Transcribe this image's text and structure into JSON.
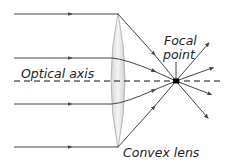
{
  "diagram": {
    "type": "optics-ray-diagram",
    "labels": {
      "optical_axis": "Optical axis",
      "focal_point_line1": "Focal",
      "focal_point_line2": "point",
      "lens": "Convex lens"
    },
    "colors": {
      "ray": "#444444",
      "axis": "#111111",
      "lens_fill": "#e6e6e6",
      "lens_stroke": "#999999",
      "text": "#222222"
    },
    "rays_incoming_y": [
      14,
      58,
      104,
      147
    ],
    "focal_point": {
      "x": 176,
      "y": 81
    }
  }
}
